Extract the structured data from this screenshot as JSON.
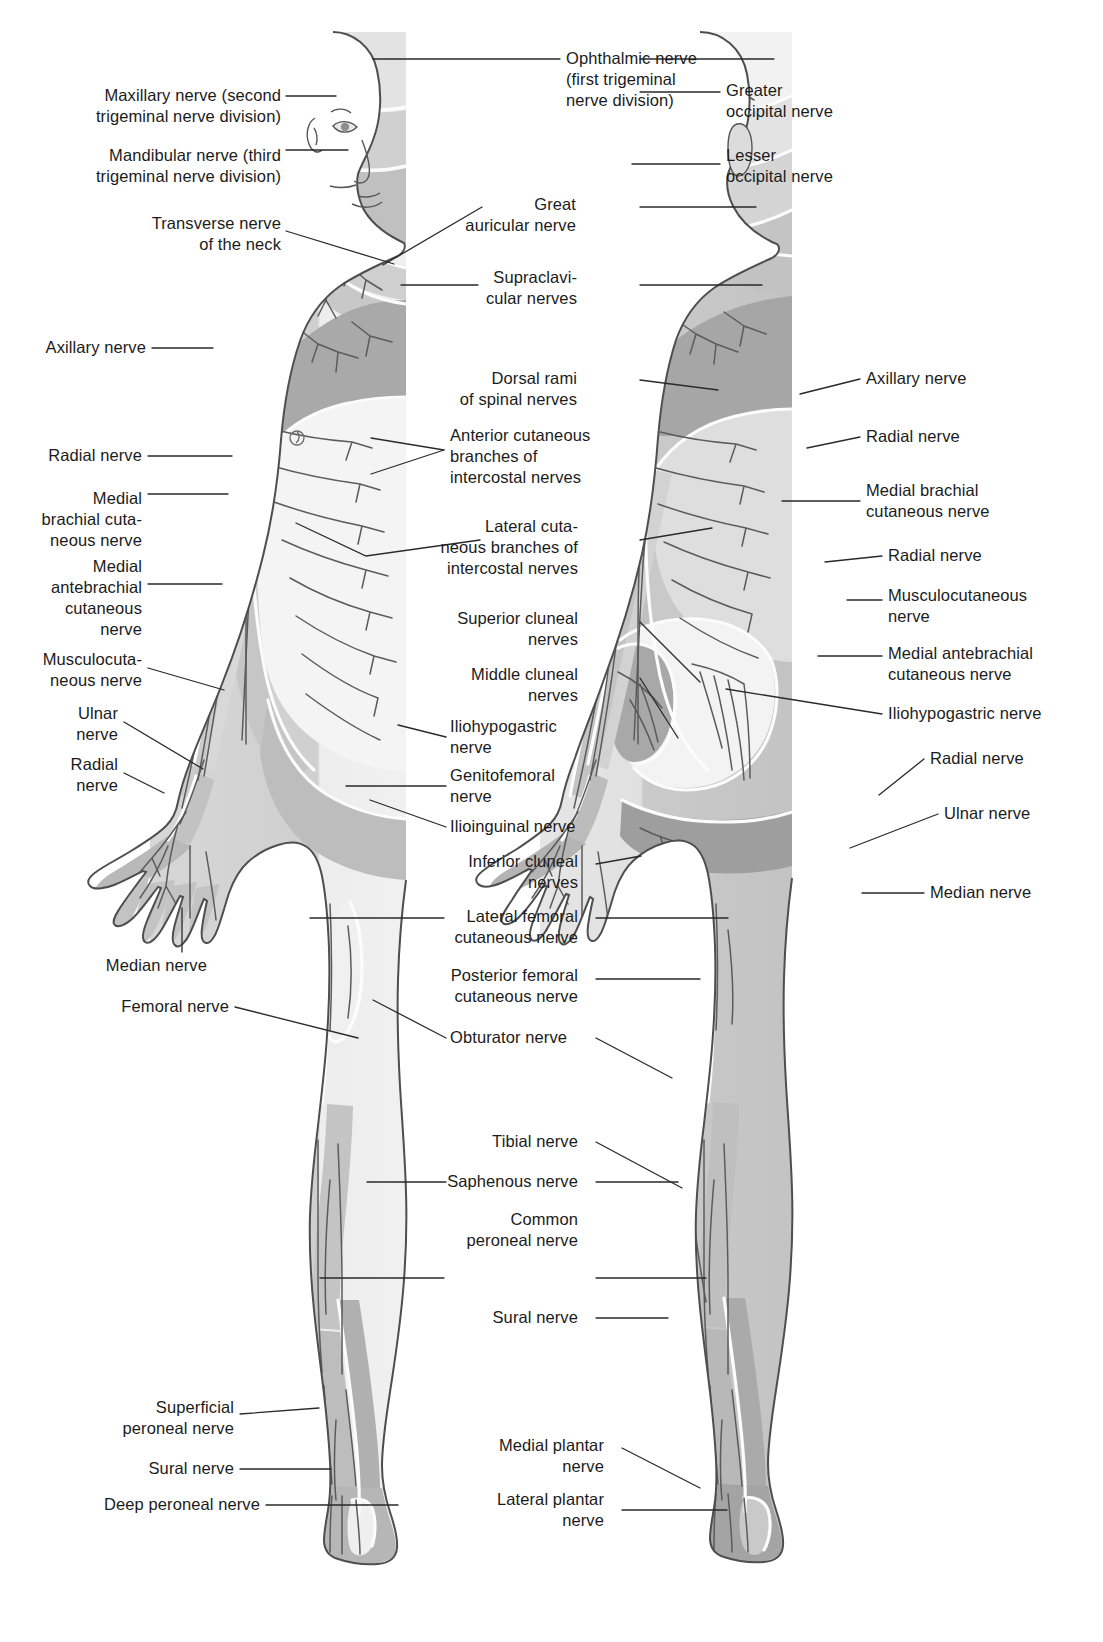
{
  "diagram": {
    "views": [
      {
        "name": "anterior-view",
        "description": "Anterior (front) view of body showing cutaneous nerve territories"
      },
      {
        "name": "posterior-view",
        "description": "Posterior (back) view of body showing cutaneous nerve territories"
      }
    ],
    "colors": {
      "background": "#ffffff",
      "leader_line": "#2a2a2a",
      "text": "#1b1b1b",
      "skin_light": "#e9e9e9",
      "skin_mid": "#c9c9c9",
      "skin_dark": "#a8a8a8",
      "skin_darker": "#909090",
      "territory_pale": "#f2f2f2",
      "outline": "#4a4a4a",
      "nerve_stroke": "#555555"
    }
  },
  "labels": {
    "left_column": [
      {
        "id": "maxillary-nerve",
        "text": "Maxillary nerve (second\ntrigeminal nerve division)",
        "x": 281,
        "y": 106,
        "tip_x": 336,
        "tip_y": 96
      },
      {
        "id": "mandibular-nerve",
        "text": "Mandibular nerve (third\ntrigeminal nerve division)",
        "x": 281,
        "y": 166,
        "tip_x": 348,
        "tip_y": 150
      },
      {
        "id": "transverse-nerve-of-the-neck",
        "text": "Transverse nerve\nof the neck",
        "x": 281,
        "y": 234,
        "tip_x": 394,
        "tip_y": 264
      },
      {
        "id": "axillary-nerve-left",
        "text": "Axillary nerve",
        "x": 146,
        "y": 348,
        "tip_x": 213,
        "tip_y": 348
      },
      {
        "id": "radial-nerve-left-upper",
        "text": "Radial nerve",
        "x": 142,
        "y": 456,
        "tip_x": 232,
        "tip_y": 456
      },
      {
        "id": "medial-brachial-cutaneous-nerve-left",
        "text": "Medial\nbrachial cuta-\nneous nerve",
        "x": 142,
        "y": 520,
        "tip_x": 228,
        "tip_y": 494
      },
      {
        "id": "medial-antebrachial-cutaneous-nerve-left",
        "text": "Medial\nantebrachial\ncutaneous\nnerve",
        "x": 142,
        "y": 598,
        "tip_x": 222,
        "tip_y": 584
      },
      {
        "id": "musculocutaneous-nerve-left",
        "text": "Musculocuta-\nneous nerve",
        "x": 142,
        "y": 670,
        "tip_x": 224,
        "tip_y": 690
      },
      {
        "id": "ulnar-nerve-left",
        "text": "Ulnar\nnerve",
        "x": 118,
        "y": 724,
        "tip_x": 203,
        "tip_y": 769
      },
      {
        "id": "radial-nerve-left-hand",
        "text": "Radial\nnerve",
        "x": 118,
        "y": 775,
        "tip_x": 164,
        "tip_y": 793
      },
      {
        "id": "median-nerve-left",
        "text": "Median nerve",
        "x": 207,
        "y": 966,
        "tip_x": 182,
        "tip_y": 908
      },
      {
        "id": "femoral-nerve-left",
        "text": "Femoral nerve",
        "x": 229,
        "y": 1007,
        "tip_x": 358,
        "tip_y": 1038
      },
      {
        "id": "superficial-peroneal-nerve",
        "text": "Superficial\nperoneal nerve",
        "x": 234,
        "y": 1418,
        "tip_x": 319,
        "tip_y": 1408
      },
      {
        "id": "sural-nerve-left",
        "text": "Sural nerve",
        "x": 234,
        "y": 1469,
        "tip_x": 331,
        "tip_y": 1469
      },
      {
        "id": "deep-peroneal-nerve",
        "text": "Deep peroneal nerve",
        "x": 260,
        "y": 1505,
        "tip_x": 398,
        "tip_y": 1505
      }
    ],
    "center_column": [
      {
        "id": "ophthalmic-nerve",
        "text": "Ophthalmic nerve\n(first trigeminal\nnerve division)",
        "x": 566,
        "y": 80,
        "tip_x": 373,
        "tip_y": 59,
        "align": "center-l",
        "tip2_x": 774,
        "tip2_y": 59
      },
      {
        "id": "great-auricular-nerve",
        "text": "Great\nauricular nerve",
        "x": 576,
        "y": 215,
        "tip_x": 383,
        "tip_y": 265,
        "align": "center-r",
        "tip2_x": 756,
        "tip2_y": 207
      },
      {
        "id": "supraclavicular-nerves",
        "text": "Supraclavi-\ncular nerves",
        "x": 577,
        "y": 288,
        "tip_x": 401,
        "tip_y": 285,
        "align": "center-r",
        "tip2_x": 762,
        "tip2_y": 285
      },
      {
        "id": "dorsal-rami-of-spinal-nerves",
        "text": "Dorsal rami\nof spinal nerves",
        "x": 577,
        "y": 389,
        "tip_x": 400,
        "tip_y": 378,
        "align": "center-r",
        "tip2_x": 718,
        "tip2_y": 390
      },
      {
        "id": "anterior-cutaneous-branches",
        "text": "Anterior cutaneous\nbranches of\nintercostal nerves",
        "x": 450,
        "y": 457,
        "tip_x": 371,
        "tip_y": 438,
        "align": "center-l",
        "tip2_x": 371,
        "tip2_y": 474
      },
      {
        "id": "lateral-cutaneous-branches",
        "text": "Lateral cuta-\nneous branches of\nintercostal nerves",
        "x": 578,
        "y": 548,
        "tip_x": 296,
        "tip_y": 523,
        "align": "center-r",
        "tip2_x": 712,
        "tip2_y": 528
      },
      {
        "id": "superior-cluneal-nerves",
        "text": "Superior cluneal\nnerves",
        "x": 578,
        "y": 629,
        "tip_x": 699,
        "tip_y": 682,
        "align": "center-r"
      },
      {
        "id": "middle-cluneal-nerves",
        "text": "Middle cluneal\nnerves",
        "x": 578,
        "y": 685,
        "tip_x": 678,
        "tip_y": 738,
        "align": "center-r"
      },
      {
        "id": "iliohypogastric-nerve-center",
        "text": "Iliohypogastric\nnerve",
        "x": 450,
        "y": 737,
        "tip_x": 398,
        "tip_y": 725,
        "align": "center-l"
      },
      {
        "id": "genitofemoral-nerve",
        "text": "Genitofemoral\nnerve",
        "x": 450,
        "y": 786,
        "tip_x": 346,
        "tip_y": 786,
        "align": "center-l"
      },
      {
        "id": "ilioinguinal-nerve",
        "text": "Ilioinguinal nerve",
        "x": 450,
        "y": 827,
        "tip_x": 370,
        "tip_y": 800,
        "align": "center-l"
      },
      {
        "id": "inferior-cluneal-nerves",
        "text": "Inferior cluneal\nnerves",
        "x": 578,
        "y": 872,
        "tip_x": 641,
        "tip_y": 856,
        "align": "center-r"
      },
      {
        "id": "lateral-femoral-cutaneous-nerve",
        "text": "Lateral femoral\ncutaneous nerve",
        "x": 578,
        "y": 927,
        "tip_x": 310,
        "tip_y": 918,
        "align": "center-r",
        "tip2_x": 728,
        "tip2_y": 918
      },
      {
        "id": "posterior-femoral-cutaneous-nerve",
        "text": "Posterior femoral\ncutaneous nerve",
        "x": 578,
        "y": 986,
        "tip_x": 0,
        "tip_y": 0,
        "align": "center-r",
        "tip2_x": 700,
        "tip2_y": 979
      },
      {
        "id": "obturator-nerve",
        "text": "Obturator nerve",
        "x": 450,
        "y": 1038,
        "tip_x": 373,
        "tip_y": 1000,
        "align": "center-l",
        "tip2_x": 672,
        "tip2_y": 1078
      },
      {
        "id": "tibial-nerve",
        "text": "Tibial nerve",
        "x": 578,
        "y": 1142,
        "tip_x": 0,
        "tip_y": 0,
        "align": "center-r",
        "tip2_x": 682,
        "tip2_y": 1188
      },
      {
        "id": "saphenous-nerve",
        "text": "Saphenous nerve",
        "x": 578,
        "y": 1182,
        "tip_x": 367,
        "tip_y": 1182,
        "align": "center-r",
        "tip2_x": 678,
        "tip2_y": 1182
      },
      {
        "id": "common-peroneal-nerve",
        "text": "Common\nperoneal nerve",
        "x": 578,
        "y": 1230,
        "tip_x": 320,
        "tip_y": 1278,
        "align": "center-r",
        "tip2_x": 706,
        "tip2_y": 1278
      },
      {
        "id": "sural-nerve-center",
        "text": "Sural nerve",
        "x": 578,
        "y": 1318,
        "tip_x": 0,
        "tip_y": 0,
        "align": "center-r",
        "tip2_x": 668,
        "tip2_y": 1318
      },
      {
        "id": "medial-plantar-nerve",
        "text": "Medial plantar\nnerve",
        "x": 604,
        "y": 1456,
        "tip_x": 0,
        "tip_y": 0,
        "align": "center-r",
        "tip2_x": 700,
        "tip2_y": 1488
      },
      {
        "id": "lateral-plantar-nerve",
        "text": "Lateral plantar\nnerve",
        "x": 604,
        "y": 1510,
        "tip_x": 0,
        "tip_y": 0,
        "align": "center-r",
        "tip2_x": 727,
        "tip2_y": 1510
      }
    ],
    "right_column": [
      {
        "id": "greater-occipital-nerve",
        "text": "Greater\noccipital nerve",
        "x": 726,
        "y": 101,
        "tip_x": 640,
        "tip_y": 92
      },
      {
        "id": "lesser-occipital-nerve",
        "text": "Lesser\noccipital nerve",
        "x": 726,
        "y": 166,
        "tip_x": 632,
        "tip_y": 164
      },
      {
        "id": "axillary-nerve-right",
        "text": "Axillary nerve",
        "x": 866,
        "y": 379,
        "tip_x": 800,
        "tip_y": 394
      },
      {
        "id": "radial-nerve-right-upper",
        "text": "Radial nerve",
        "x": 866,
        "y": 437,
        "tip_x": 807,
        "tip_y": 448
      },
      {
        "id": "medial-brachial-cutaneous-nerve-right",
        "text": "Medial brachial\ncutaneous nerve",
        "x": 866,
        "y": 501,
        "tip_x": 782,
        "tip_y": 501
      },
      {
        "id": "radial-nerve-right-forearm",
        "text": "Radial nerve",
        "x": 888,
        "y": 556,
        "tip_x": 825,
        "tip_y": 562
      },
      {
        "id": "musculocutaneous-nerve-right",
        "text": "Musculocutaneous\nnerve",
        "x": 888,
        "y": 606,
        "tip_x": 847,
        "tip_y": 600
      },
      {
        "id": "medial-antebrachial-cutaneous-nerve-right",
        "text": "Medial antebrachial\ncutaneous nerve",
        "x": 888,
        "y": 664,
        "tip_x": 818,
        "tip_y": 656
      },
      {
        "id": "iliohypogastric-nerve-right",
        "text": "Iliohypogastric nerve",
        "x": 888,
        "y": 714,
        "tip_x": 726,
        "tip_y": 689
      },
      {
        "id": "radial-nerve-right-hand",
        "text": "Radial nerve",
        "x": 930,
        "y": 759,
        "tip_x": 879,
        "tip_y": 795
      },
      {
        "id": "ulnar-nerve-right",
        "text": "Ulnar nerve",
        "x": 944,
        "y": 814,
        "tip_x": 850,
        "tip_y": 848
      },
      {
        "id": "median-nerve-right",
        "text": "Median nerve",
        "x": 930,
        "y": 893,
        "tip_x": 862,
        "tip_y": 893
      }
    ]
  }
}
